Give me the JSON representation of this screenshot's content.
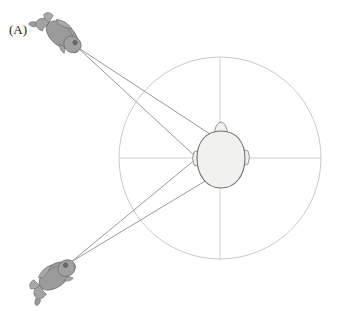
{
  "figure": {
    "panel_label": "(A)",
    "background_color": "#ffffff"
  },
  "colors": {
    "arena_circle_stroke": "#c9c9c9",
    "axis_line_stroke": "#cfcfcf",
    "ray_line_stroke": "#8e8e8e",
    "head_fill": "#f1f1ef",
    "head_stroke": "#8a8a8a",
    "frog_body_fill": "#9b9b9b",
    "frog_body_stroke": "#6f6f6f",
    "frog_limb_fill": "#a8a8a8",
    "label_color": "#1a1a1a"
  },
  "arena": {
    "name": "circular-arena",
    "center_x": 220,
    "center_y": 158,
    "radius": 101,
    "stroke_width": 1
  },
  "axes": {
    "horizontal": {
      "x1": 119,
      "y1": 158,
      "x2": 322,
      "y2": 158
    },
    "vertical": {
      "x1": 220,
      "y1": 57,
      "x2": 220,
      "y2": 260
    }
  },
  "head": {
    "name": "listener-head",
    "center_x": 221,
    "center_y": 159,
    "rx": 24,
    "ry": 28,
    "nose_x": 221,
    "nose_y": 125,
    "left_ear": {
      "x": 197,
      "y": 158
    },
    "right_ear": {
      "x": 245,
      "y": 157
    }
  },
  "sound_sources": [
    {
      "name": "frog-upper-left",
      "label": "frog",
      "x": 62,
      "y": 35,
      "rotation_deg": 38,
      "emit_x": 77,
      "emit_y": 47
    },
    {
      "name": "frog-lower-left",
      "label": "frog",
      "x": 55,
      "y": 276,
      "rotation_deg": -38,
      "emit_x": 71,
      "emit_y": 262
    }
  ],
  "rays": [
    {
      "name": "ray-upper-frog-to-left-ear",
      "x1": 77,
      "y1": 47,
      "x2": 197,
      "y2": 158
    },
    {
      "name": "ray-upper-frog-to-right-ear",
      "x1": 77,
      "y1": 47,
      "x2": 245,
      "y2": 157
    },
    {
      "name": "ray-lower-frog-to-left-ear",
      "x1": 71,
      "y1": 262,
      "x2": 197,
      "y2": 158
    },
    {
      "name": "ray-lower-frog-to-right-ear",
      "x1": 71,
      "y1": 262,
      "x2": 245,
      "y2": 157
    }
  ]
}
